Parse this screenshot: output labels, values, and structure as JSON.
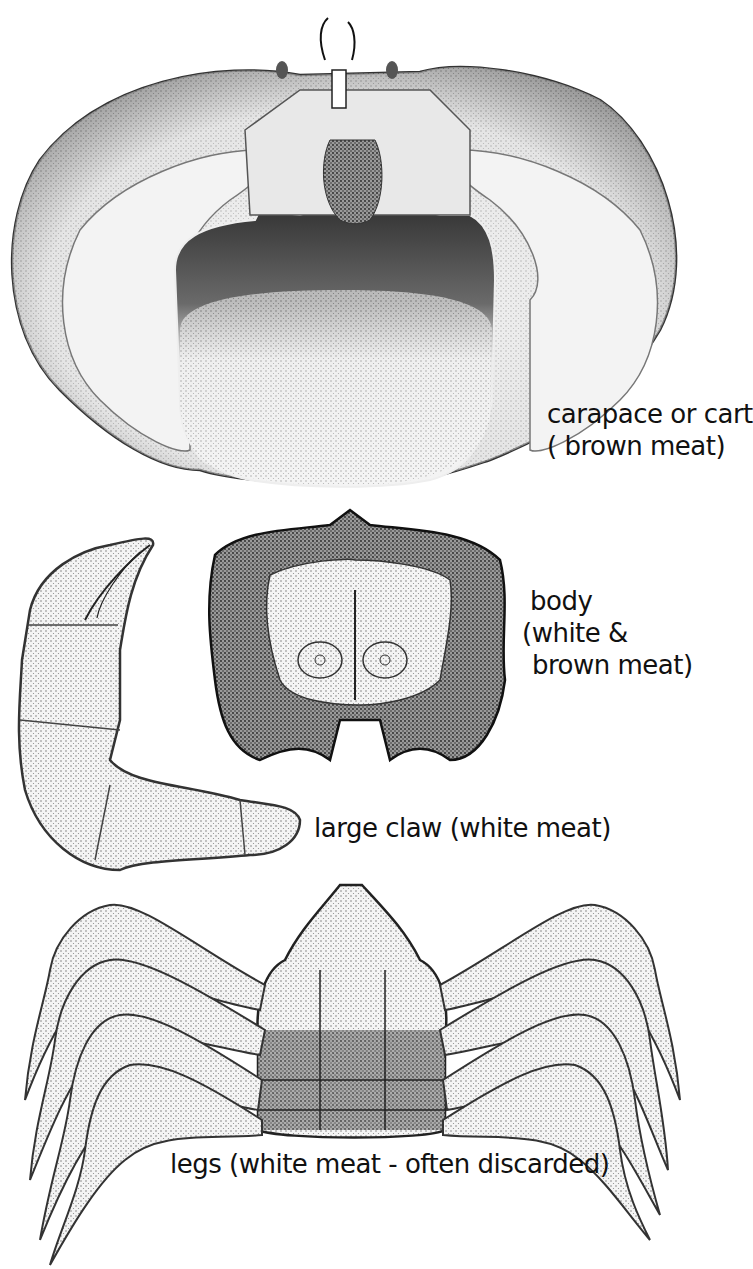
{
  "figure": {
    "parts": [
      {
        "id": "carapace",
        "lines": [
          "carapace or cart",
          "( brown  meat)"
        ]
      },
      {
        "id": "body",
        "lines": [
          "body",
          "(white &",
          " brown meat)"
        ]
      },
      {
        "id": "claw",
        "lines": [
          "large  claw (white meat)"
        ]
      },
      {
        "id": "legs",
        "lines": [
          "legs (white  meat - often discarded)"
        ]
      }
    ],
    "colors": {
      "ink": "#111111",
      "background": "#ffffff",
      "stipple_light": "#e6e6e6",
      "stipple_dark": "#555555"
    }
  }
}
